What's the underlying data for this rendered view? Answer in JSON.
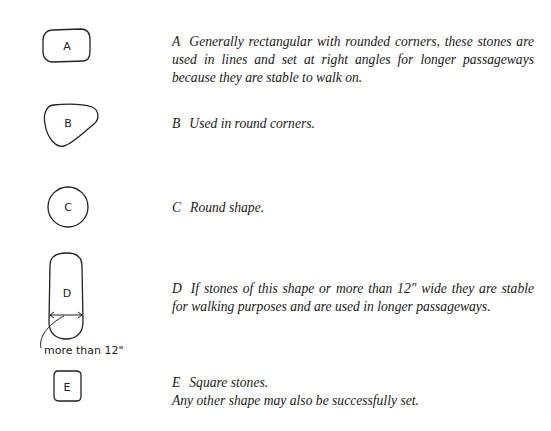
{
  "items": [
    {
      "letter": "A",
      "shape": "rounded-rectangle",
      "text": "Generally rectangular with rounded corners, these stones are used in lines and set at right angles for longer passageways because they are stable to walk on."
    },
    {
      "letter": "B",
      "shape": "rounded-triangle",
      "text": "Used in round corners."
    },
    {
      "letter": "C",
      "shape": "circle",
      "text": "Round shape."
    },
    {
      "letter": "D",
      "shape": "elongated-oval",
      "text": "If stones of this shape or more than 12\" wide they are stable for walking purposes and are used in longer passageways."
    },
    {
      "letter": "E",
      "shape": "square",
      "text": "Square stones.",
      "extra": "Any other shape may also be successfully set."
    }
  ],
  "annotations": {
    "d_width_note": "more than 12\""
  }
}
